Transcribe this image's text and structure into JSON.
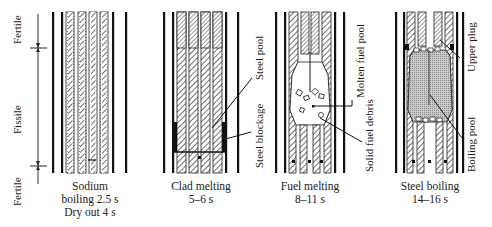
{
  "figure": {
    "zones": {
      "top": "Fertile",
      "middle": "Fissile",
      "bottom": "Fertile"
    },
    "panels": [
      {
        "id": "sodium-boiling",
        "caption": [
          "Sodium",
          "boiling 2.5 s",
          "Dry out 4 s"
        ],
        "annotations": []
      },
      {
        "id": "clad-melting",
        "caption": [
          "Clad melting",
          "5–6 s"
        ],
        "annotations": [
          "Steel pool",
          "Steel blockage"
        ]
      },
      {
        "id": "fuel-melting",
        "caption": [
          "Fuel melting",
          "8–11 s"
        ],
        "annotations": [
          "Molten fuel pool",
          "Solid fuel debris"
        ]
      },
      {
        "id": "steel-boiling",
        "caption": [
          "Steel boiling",
          "14–16 s"
        ],
        "annotations": [
          "Upper plug",
          "Boiling pool"
        ]
      }
    ]
  }
}
